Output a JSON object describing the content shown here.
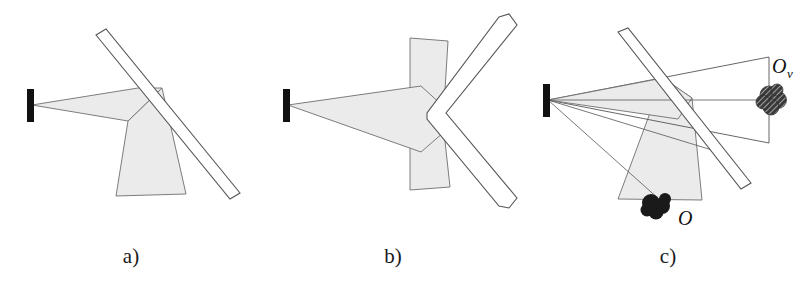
{
  "figure": {
    "background_color": "#ffffff",
    "stroke_color": "#555555",
    "cone_fill_color": "#ebebeb",
    "detector_color": "#111111",
    "object_color": "#1a1a1a",
    "mirror_fill_color": "#ffffff"
  },
  "panels": [
    {
      "id": "a",
      "caption": "a)",
      "description": "Flat mirror deflecting the detector cone downward",
      "elements": {
        "detector": "detector-bar",
        "mirror": "flat-mirror-bar",
        "cone": "detector-field-of-view-cone",
        "reflected_cone": "reflected-field-of-view-cone"
      }
    },
    {
      "id": "b",
      "caption": "b)",
      "description": "V-shaped mirror splitting the detector cone vertically",
      "elements": {
        "detector": "detector-bar",
        "mirror": "v-mirror-bar",
        "cone": "detector-field-of-view-cone",
        "reflected_cone": "split-field-of-view-cone"
      }
    },
    {
      "id": "c",
      "caption": "c)",
      "description": "Flat mirror with real object O and virtual image O_v",
      "elements": {
        "detector": "detector-bar",
        "mirror": "flat-mirror-bar",
        "cone": "detector-field-of-view-cone",
        "reflected_cone": "reflected-field-of-view-cone",
        "object": "real-object-blob",
        "virtual_object": "virtual-object-blob"
      },
      "labels": {
        "object": "O",
        "virtual_object": "O",
        "virtual_object_subscript": "v"
      }
    }
  ]
}
